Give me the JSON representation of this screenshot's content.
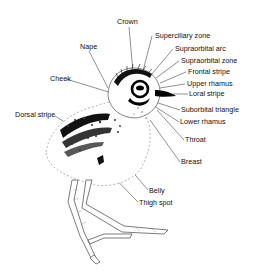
{
  "diagram": {
    "labels": [
      {
        "id": "crown",
        "text": "Crown",
        "x": 117,
        "y": 18
      },
      {
        "id": "superciliary-zone",
        "text": "Superciliary zone",
        "x": 155,
        "y": 32
      },
      {
        "id": "supraorbital-arc",
        "text": "Supraorbital arc",
        "x": 175,
        "y": 45
      },
      {
        "id": "supraorbital-zone",
        "text": "Supraorbital zone",
        "x": 181,
        "y": 57
      },
      {
        "id": "frontal-stripe",
        "text": "Frontal stripe",
        "x": 188,
        "y": 68
      },
      {
        "id": "nape",
        "text": "Nape",
        "x": 80,
        "y": 43
      },
      {
        "id": "upper-rhamus",
        "text": "Upper rhamus",
        "x": 187,
        "y": 80
      },
      {
        "id": "loral-stripe",
        "text": "Loral stripe",
        "x": 189,
        "y": 90
      },
      {
        "id": "cheek",
        "text": "Cheek",
        "x": 50,
        "y": 75
      },
      {
        "id": "suborbital-triangle",
        "text": "Suborbital triangle",
        "x": 181,
        "y": 106
      },
      {
        "id": "dorsal-stripe",
        "text": "Dorsal stripe",
        "x": 15,
        "y": 111
      },
      {
        "id": "lower-rhamus",
        "text": "Lower rhamus",
        "x": 180,
        "y": 118
      },
      {
        "id": "throat",
        "text": "Throat",
        "x": 185,
        "y": 136
      },
      {
        "id": "breast",
        "text": "Breast",
        "x": 181,
        "y": 158
      },
      {
        "id": "belly",
        "text": "Belly",
        "x": 149,
        "y": 187
      },
      {
        "id": "thigh-spot",
        "text": "Thigh spot",
        "x": 139,
        "y": 199
      }
    ]
  }
}
